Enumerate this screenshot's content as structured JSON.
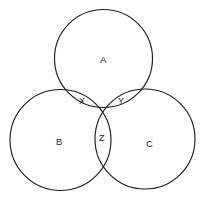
{
  "diagram": {
    "type": "venn-three-circles",
    "background_color": "#ffffff",
    "stroke_color": "#1c1c1c",
    "text_color": "#2a2a2a",
    "circles": [
      {
        "id": "A",
        "label": "A",
        "cx": 103.5,
        "cy": 58.5,
        "r": 49.0,
        "label_x": 100,
        "label_y": 55
      },
      {
        "id": "B",
        "label": "B",
        "cx": 60.5,
        "cy": 140.0,
        "r": 50.5,
        "label_x": 56,
        "label_y": 137
      },
      {
        "id": "C",
        "label": "C",
        "cx": 145.0,
        "cy": 139.0,
        "r": 50.0,
        "label_x": 146,
        "label_y": 139
      }
    ],
    "intersection_labels": [
      {
        "id": "X",
        "label": "X",
        "description": "intersection of A and B",
        "label_x": 79,
        "label_y": 96
      },
      {
        "id": "Y",
        "label": "Y",
        "description": "intersection of A and C",
        "label_x": 118,
        "label_y": 96
      },
      {
        "id": "Z",
        "label": "Z",
        "description": "intersection of B and C",
        "label_x": 99,
        "label_y": 133
      }
    ]
  }
}
